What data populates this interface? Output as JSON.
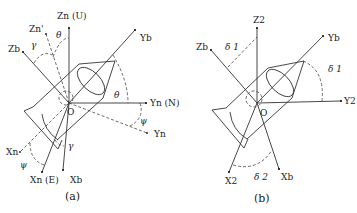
{
  "figure": {
    "panels": [
      {
        "id": "a",
        "caption": "(a)",
        "origin_label": "O",
        "axes": {
          "zn_u": "Zn (U)",
          "yn_n": "Yn (N)",
          "zb": "Zb",
          "yb": "Yb",
          "zn_prime": "Zn'",
          "yn": "Yn",
          "xn_e": "Xn (E)",
          "xb": "Xb",
          "xn": "Xn"
        },
        "angles": {
          "theta_top": "θ",
          "gamma_top": "γ",
          "theta_right": "θ",
          "psi_right": "ψ",
          "psi_left": "ψ",
          "gamma_bottom": "γ"
        }
      },
      {
        "id": "b",
        "caption": "(b)",
        "origin_label": "O",
        "axes": {
          "z2": "Z2",
          "zb": "Zb",
          "yb": "Yb",
          "y2": "Y2",
          "x2": "X2",
          "xb": "Xb"
        },
        "angles": {
          "delta1_top": "δ 1",
          "delta1_right": "δ 1",
          "delta2_bottom": "δ 2"
        }
      }
    ]
  }
}
